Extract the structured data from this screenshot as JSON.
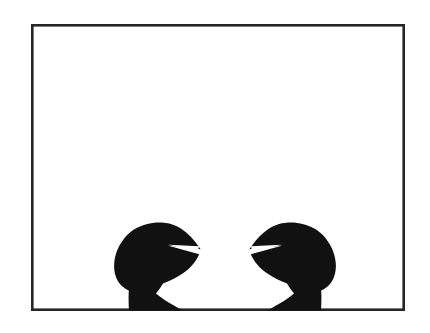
{
  "image": {
    "title": "Crab claws silhouette",
    "caption": "",
    "width": 430,
    "height": 333,
    "background_color": "#ffffff",
    "subject": "two black crab claw silhouettes rising from the bottom edge of a framed white panel"
  },
  "frame": {
    "name": "rectangular-border",
    "stroke_color": "#262626",
    "stroke_width": 2.6,
    "fill_color": "#ffffff",
    "x": 31,
    "y": 24,
    "width": 374,
    "height": 287
  },
  "figures": [
    {
      "id": "left-claw",
      "label": "Left crab claw silhouette",
      "fill_color": "#111111",
      "facing": "right",
      "bbox": {
        "x": 114,
        "y": 221,
        "width": 88,
        "height": 90
      },
      "pincer_gap": "V-shaped white notch opening toward the right"
    },
    {
      "id": "right-claw",
      "label": "Right crab claw silhouette",
      "fill_color": "#111111",
      "facing": "left",
      "bbox": {
        "x": 248,
        "y": 221,
        "width": 88,
        "height": 90
      },
      "pincer_gap": "V-shaped white notch opening toward the left"
    }
  ],
  "gap": {
    "name": "gap-between-claw-tips",
    "x_start": 202,
    "x_end": 248,
    "width": 46
  },
  "colors": {
    "silhouette": "#111111",
    "border": "#262626",
    "canvas": "#ffffff",
    "page": "#ffffff"
  }
}
